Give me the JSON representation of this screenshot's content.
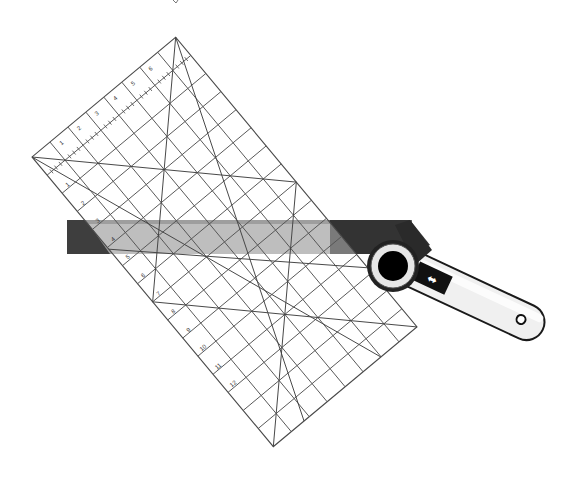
{
  "illustration": {
    "title": "Rotary cutter and quilting ruler",
    "description": "Line illustration of a transparent grid quilting ruler laid diagonally with a dark straightedge and a rotary cutter",
    "colors": {
      "background": "#ffffff",
      "ruler_lines": "#4a4a4a",
      "straightedge_light": "#9a9a9a",
      "straightedge_dark": "#3a3a3a",
      "cutter_handle": "#f2f2f2",
      "cutter_outline": "#1a1a1a",
      "blade_hub": "#000000"
    },
    "ruler": {
      "label": "quilting-ruler",
      "corners": {
        "top": [
          176,
          37
        ],
        "right": [
          411,
          332
        ],
        "bottom": [
          268,
          454
        ],
        "left": [
          32,
          157
        ]
      },
      "grid_columns": 8,
      "grid_rows": 16
    },
    "straightedge": {
      "label": "straightedge"
    },
    "cutter": {
      "label": "rotary-cutter",
      "slider_icon": "double-arrow-icon",
      "slider_glyph": "⬌"
    }
  }
}
